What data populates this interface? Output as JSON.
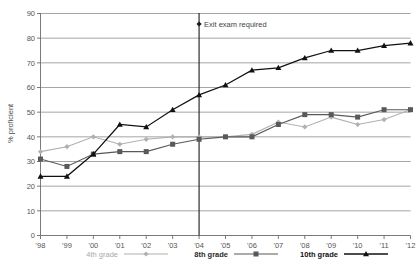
{
  "chart_data": {
    "type": "line",
    "title": "",
    "xlabel": "",
    "ylabel": "% proficient",
    "ylim": [
      0,
      90
    ],
    "ytick_step": 10,
    "yticks": [
      0,
      10,
      20,
      30,
      40,
      50,
      60,
      70,
      80,
      90
    ],
    "grid": true,
    "legend_position": "bottom",
    "categories": [
      "'98",
      "'99",
      "'00",
      "'01",
      "'02",
      "'03",
      "'04",
      "'05",
      "'06",
      "'07",
      "'08",
      "'09",
      "'10",
      "'11",
      "'12"
    ],
    "x": [
      1998,
      1999,
      2000,
      2001,
      2002,
      2003,
      2004,
      2005,
      2006,
      2007,
      2008,
      2009,
      2010,
      2011,
      2012
    ],
    "series": [
      {
        "name": "4th grade",
        "color": "#b0b0b0",
        "marker": "diamond",
        "values": [
          34,
          36,
          40,
          37,
          39,
          40,
          40,
          40,
          41,
          46,
          44,
          48,
          45,
          47,
          51
        ]
      },
      {
        "name": "8th grade",
        "color": "#595959",
        "marker": "square",
        "values": [
          31,
          28,
          33,
          34,
          34,
          37,
          39,
          40,
          40,
          45,
          49,
          49,
          48,
          51,
          51
        ]
      },
      {
        "name": "10th grade",
        "color": "#111111",
        "marker": "triangle",
        "values": [
          24,
          24,
          33,
          45,
          44,
          51,
          57,
          61,
          67,
          68,
          72,
          75,
          75,
          77,
          78
        ]
      }
    ],
    "annotations": [
      {
        "text": "Exit exam required",
        "x": 2004,
        "marker": "diamond",
        "vertical_rule": true
      }
    ]
  },
  "legend": {
    "items": [
      {
        "label": "4th grade"
      },
      {
        "label": "8th grade"
      },
      {
        "label": "10th grade"
      }
    ]
  },
  "axes": {
    "y_title": "% proficient"
  }
}
